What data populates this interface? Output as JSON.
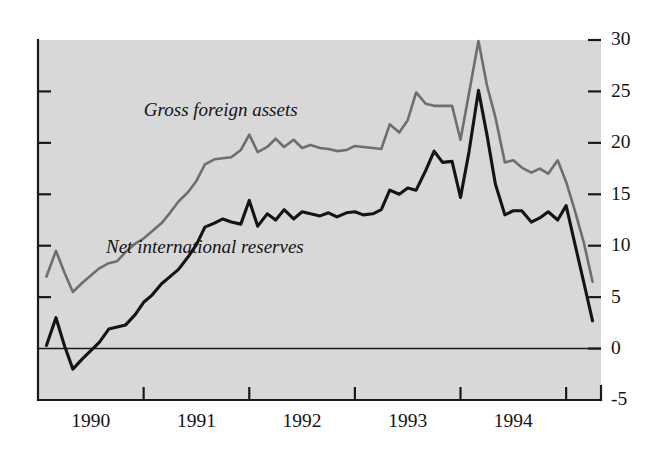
{
  "chart_data": {
    "type": "line",
    "title": "",
    "subtitle": "",
    "xlabel": "",
    "ylabel": "",
    "xlim": [
      1989.5,
      1994.83
    ],
    "ylim": [
      -5,
      30
    ],
    "grid": false,
    "legend_position": "inline-annotation",
    "y_ticks": [
      {
        "value": 30,
        "label": "30"
      },
      {
        "value": 25,
        "label": "25"
      },
      {
        "value": 20,
        "label": "20"
      },
      {
        "value": 15,
        "label": "15"
      },
      {
        "value": 10,
        "label": "10"
      },
      {
        "value": 5,
        "label": "5"
      },
      {
        "value": 0,
        "label": "0"
      },
      {
        "value": -5,
        "label": "-5"
      }
    ],
    "x_ticks": [
      {
        "value": 1989.5,
        "label": ""
      },
      {
        "value": 1990.5,
        "label": ""
      },
      {
        "value": 1991.5,
        "label": ""
      },
      {
        "value": 1992.5,
        "label": ""
      },
      {
        "value": 1993.5,
        "label": ""
      },
      {
        "value": 1994.5,
        "label": ""
      }
    ],
    "x_tick_labels": [
      {
        "value": 1990.0,
        "label": "1990"
      },
      {
        "value": 1991.0,
        "label": "1991"
      },
      {
        "value": 1992.0,
        "label": "1992"
      },
      {
        "value": 1993.0,
        "label": "1993"
      },
      {
        "value": 1994.0,
        "label": "1994"
      }
    ],
    "zero_reference_line": 0,
    "series": [
      {
        "name": "Gross foreign assets",
        "color": "#6e6e6e",
        "annotation": {
          "text": "Gross foreign assets",
          "x": 1991.23,
          "y": 22.6
        },
        "x": [
          1989.58,
          1989.67,
          1989.75,
          1989.83,
          1989.92,
          1990.0,
          1990.08,
          1990.17,
          1990.25,
          1990.33,
          1990.42,
          1990.5,
          1990.58,
          1990.67,
          1990.75,
          1990.83,
          1990.92,
          1991.0,
          1991.08,
          1991.17,
          1991.25,
          1991.33,
          1991.42,
          1991.5,
          1991.58,
          1991.67,
          1991.75,
          1991.83,
          1991.92,
          1992.0,
          1992.08,
          1992.17,
          1992.25,
          1992.33,
          1992.42,
          1992.5,
          1992.58,
          1992.67,
          1992.75,
          1992.83,
          1992.92,
          1993.0,
          1993.08,
          1993.17,
          1993.25,
          1993.33,
          1993.42,
          1993.5,
          1993.58,
          1993.67,
          1993.75,
          1993.83,
          1993.92,
          1994.0,
          1994.08,
          1994.17,
          1994.25,
          1994.33,
          1994.42,
          1994.5,
          1994.58,
          1994.67,
          1994.75
        ],
        "values": [
          7.0,
          9.5,
          7.4,
          5.5,
          6.4,
          7.1,
          7.8,
          8.3,
          8.5,
          9.4,
          10.2,
          10.7,
          11.4,
          12.2,
          13.2,
          14.3,
          15.2,
          16.3,
          17.9,
          18.4,
          18.5,
          18.6,
          19.3,
          20.8,
          19.1,
          19.6,
          20.4,
          19.6,
          20.3,
          19.5,
          19.8,
          19.5,
          19.4,
          19.2,
          19.3,
          19.7,
          19.6,
          19.5,
          19.4,
          21.8,
          21.0,
          22.2,
          24.9,
          23.8,
          23.6,
          23.6,
          23.6,
          20.3,
          24.8,
          29.9,
          25.6,
          22.5,
          18.1,
          18.3,
          17.6,
          17.1,
          17.5,
          17.0,
          18.3,
          16.2,
          13.5,
          10.2,
          6.5
        ]
      },
      {
        "name": "Net international reserves",
        "color": "#141414",
        "annotation": {
          "text": "Net international reserves",
          "x": 1991.08,
          "y": 9.3
        },
        "x": [
          1989.58,
          1989.67,
          1989.75,
          1989.83,
          1989.92,
          1990.0,
          1990.08,
          1990.17,
          1990.25,
          1990.33,
          1990.42,
          1990.5,
          1990.58,
          1990.67,
          1990.75,
          1990.83,
          1990.92,
          1991.0,
          1991.08,
          1991.17,
          1991.25,
          1991.33,
          1991.42,
          1991.5,
          1991.58,
          1991.67,
          1991.75,
          1991.83,
          1991.92,
          1992.0,
          1992.08,
          1992.17,
          1992.25,
          1992.33,
          1992.42,
          1992.5,
          1992.58,
          1992.67,
          1992.75,
          1992.83,
          1992.92,
          1993.0,
          1993.08,
          1993.17,
          1993.25,
          1993.33,
          1993.42,
          1993.5,
          1993.58,
          1993.67,
          1993.75,
          1993.83,
          1993.92,
          1994.0,
          1994.08,
          1994.17,
          1994.25,
          1994.33,
          1994.42,
          1994.5,
          1994.58,
          1994.67,
          1994.75
        ],
        "values": [
          0.3,
          3.0,
          0.3,
          -2.0,
          -1.0,
          -0.2,
          0.6,
          1.9,
          2.1,
          2.3,
          3.3,
          4.5,
          5.2,
          6.3,
          7.0,
          7.7,
          8.9,
          10.1,
          11.8,
          12.2,
          12.6,
          12.3,
          12.1,
          14.4,
          11.9,
          13.1,
          12.5,
          13.5,
          12.6,
          13.3,
          13.1,
          12.9,
          13.2,
          12.8,
          13.2,
          13.3,
          13.0,
          13.1,
          13.5,
          15.4,
          15.0,
          15.6,
          15.4,
          17.3,
          19.2,
          18.1,
          18.2,
          14.7,
          19.1,
          25.1,
          20.8,
          16.0,
          13.0,
          13.4,
          13.4,
          12.3,
          12.7,
          13.3,
          12.5,
          13.9,
          10.3,
          6.3,
          2.7
        ]
      }
    ]
  },
  "axes": {
    "background_color": "#d8d8d8",
    "axis_color": "#1a1a1a",
    "y_label_side": "right",
    "x_label_side": "bottom"
  }
}
